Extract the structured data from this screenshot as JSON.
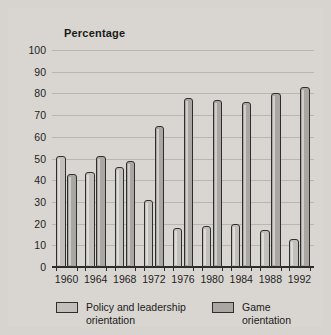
{
  "figure": {
    "width": 331,
    "height": 335,
    "background_color": "#d7d4cf",
    "plate_color": "#d9d6d1"
  },
  "chart_data": {
    "type": "bar",
    "title": "Percentage",
    "xlabel": "",
    "ylabel": "",
    "ylim": [
      0,
      100
    ],
    "ytick_step": 10,
    "yticks": [
      100,
      90,
      80,
      70,
      60,
      50,
      40,
      30,
      20,
      10,
      0
    ],
    "grid": true,
    "grid_axis": "y",
    "legend_position": "bottom",
    "categories": [
      "1960",
      "1964",
      "1968",
      "1972",
      "1976",
      "1980",
      "1984",
      "1988",
      "1992"
    ],
    "series": [
      {
        "name": "Policy and leadership orientation",
        "color": "#c3c0bb",
        "values": [
          51,
          44,
          46,
          31,
          18,
          19,
          20,
          17,
          13
        ]
      },
      {
        "name": "Game orientation",
        "color": "#aaa7a2",
        "values": [
          43,
          51,
          49,
          65,
          78,
          77,
          76,
          80,
          83
        ]
      }
    ]
  },
  "legend": {
    "entries": [
      {
        "label": "Policy and leadership\norientation",
        "swatch": "policy"
      },
      {
        "label": "Game orientation",
        "swatch": "game"
      }
    ]
  }
}
